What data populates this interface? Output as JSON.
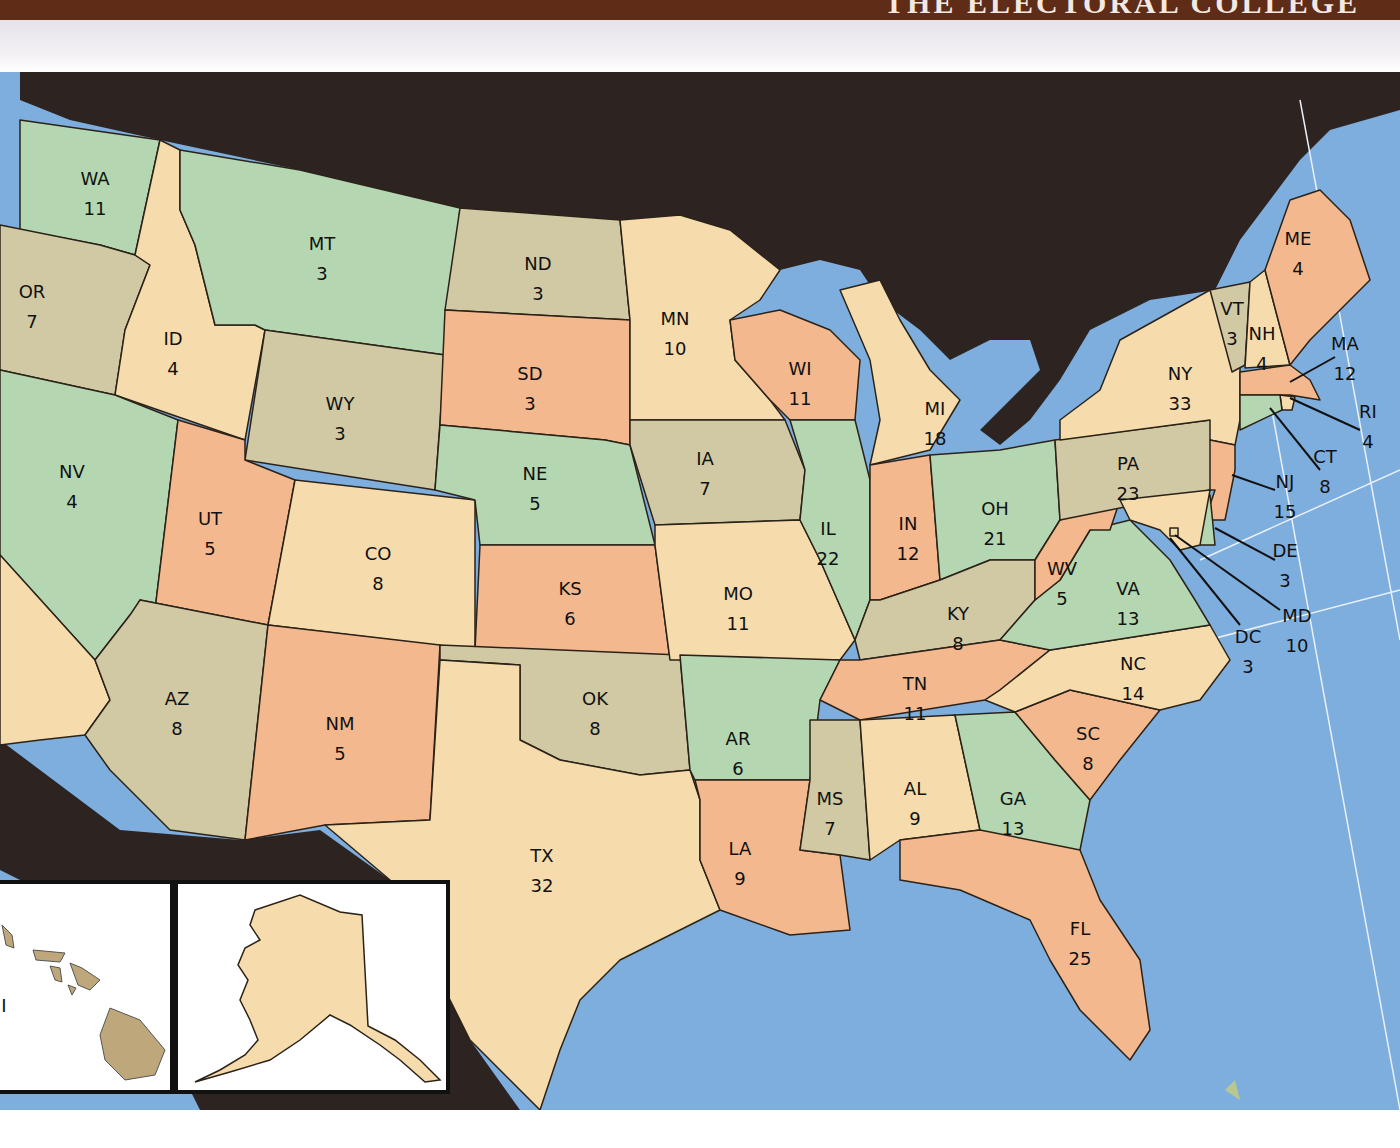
{
  "header": {
    "title": "THE ELECTORAL COLLEGE"
  },
  "colors": {
    "green": "#b4d7b1",
    "tan": "#f6dcac",
    "khaki": "#d0c9a4",
    "orange": "#f4b88e",
    "water": "#7eaede",
    "foreign_land": "#2d2422",
    "header_brown": "#5e2c17",
    "hawaii": "#bfa77c"
  },
  "states": [
    {
      "abbr": "WA",
      "votes": "11",
      "color": "green"
    },
    {
      "abbr": "OR",
      "votes": "7",
      "color": "khaki"
    },
    {
      "abbr": "ID",
      "votes": "4",
      "color": "tan"
    },
    {
      "abbr": "MT",
      "votes": "3",
      "color": "green"
    },
    {
      "abbr": "WY",
      "votes": "3",
      "color": "khaki"
    },
    {
      "abbr": "NV",
      "votes": "4",
      "color": "green"
    },
    {
      "abbr": "CA",
      "votes": "",
      "color": "tan"
    },
    {
      "abbr": "UT",
      "votes": "5",
      "color": "orange"
    },
    {
      "abbr": "CO",
      "votes": "8",
      "color": "tan"
    },
    {
      "abbr": "AZ",
      "votes": "8",
      "color": "khaki"
    },
    {
      "abbr": "NM",
      "votes": "5",
      "color": "orange"
    },
    {
      "abbr": "ND",
      "votes": "3",
      "color": "khaki"
    },
    {
      "abbr": "SD",
      "votes": "3",
      "color": "orange"
    },
    {
      "abbr": "NE",
      "votes": "5",
      "color": "green"
    },
    {
      "abbr": "KS",
      "votes": "6",
      "color": "orange"
    },
    {
      "abbr": "OK",
      "votes": "8",
      "color": "khaki"
    },
    {
      "abbr": "TX",
      "votes": "32",
      "color": "tan"
    },
    {
      "abbr": "MN",
      "votes": "10",
      "color": "tan"
    },
    {
      "abbr": "IA",
      "votes": "7",
      "color": "khaki"
    },
    {
      "abbr": "MO",
      "votes": "11",
      "color": "tan"
    },
    {
      "abbr": "AR",
      "votes": "6",
      "color": "green"
    },
    {
      "abbr": "LA",
      "votes": "9",
      "color": "orange"
    },
    {
      "abbr": "WI",
      "votes": "11",
      "color": "orange"
    },
    {
      "abbr": "IL",
      "votes": "22",
      "color": "green"
    },
    {
      "abbr": "MI",
      "votes": "18",
      "color": "tan"
    },
    {
      "abbr": "IN",
      "votes": "12",
      "color": "orange"
    },
    {
      "abbr": "OH",
      "votes": "21",
      "color": "green"
    },
    {
      "abbr": "KY",
      "votes": "8",
      "color": "khaki"
    },
    {
      "abbr": "TN",
      "votes": "11",
      "color": "orange"
    },
    {
      "abbr": "MS",
      "votes": "7",
      "color": "khaki"
    },
    {
      "abbr": "AL",
      "votes": "9",
      "color": "tan"
    },
    {
      "abbr": "GA",
      "votes": "13",
      "color": "green"
    },
    {
      "abbr": "FL",
      "votes": "25",
      "color": "orange"
    },
    {
      "abbr": "SC",
      "votes": "8",
      "color": "orange"
    },
    {
      "abbr": "NC",
      "votes": "14",
      "color": "tan"
    },
    {
      "abbr": "VA",
      "votes": "13",
      "color": "green"
    },
    {
      "abbr": "WV",
      "votes": "5",
      "color": "orange"
    },
    {
      "abbr": "PA",
      "votes": "23",
      "color": "khaki"
    },
    {
      "abbr": "NY",
      "votes": "33",
      "color": "tan"
    },
    {
      "abbr": "VT",
      "votes": "3",
      "color": "khaki"
    },
    {
      "abbr": "NH",
      "votes": "4",
      "color": "tan"
    },
    {
      "abbr": "ME",
      "votes": "4",
      "color": "orange"
    },
    {
      "abbr": "MA",
      "votes": "12",
      "color": "orange"
    },
    {
      "abbr": "RI",
      "votes": "4",
      "color": "tan"
    },
    {
      "abbr": "CT",
      "votes": "8",
      "color": "green"
    },
    {
      "abbr": "NJ",
      "votes": "15",
      "color": "orange"
    },
    {
      "abbr": "DE",
      "votes": "3",
      "color": "green"
    },
    {
      "abbr": "MD",
      "votes": "10",
      "color": "tan"
    },
    {
      "abbr": "DC",
      "votes": "3",
      "color": "tan"
    },
    {
      "abbr": "AK",
      "votes": "3",
      "color": "tan"
    },
    {
      "abbr": "HI",
      "votes": "",
      "color": "hawaii"
    }
  ],
  "insets": {
    "hawaii_partial_label": "I"
  }
}
